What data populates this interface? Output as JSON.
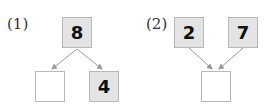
{
  "problems": [
    {
      "label": "(1)",
      "top": [
        {
          "value": "8"
        }
      ],
      "bottom": [
        {
          "value": ""
        },
        {
          "value": "4"
        }
      ]
    },
    {
      "label": "(2)",
      "top": [
        {
          "value": "2"
        },
        {
          "value": "7"
        }
      ],
      "bottom": [
        {
          "value": ""
        }
      ]
    }
  ],
  "colors": {
    "filled_box": "#e4e4e4",
    "empty_box": "#ffffff",
    "border": "#b8b8b8",
    "arrow": "#999999"
  }
}
